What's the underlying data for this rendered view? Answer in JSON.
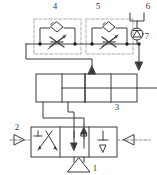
{
  "diagram": {
    "type": "pneumatic-hydraulic-schematic",
    "colors": {
      "line": "#3a3a3a",
      "dashed": "#8c8c8c",
      "background": "#ffffff",
      "node": "#1a1a1a"
    },
    "callouts": [
      {
        "id": "c1",
        "label": "1",
        "x": 84,
        "y": 168,
        "refers_to": "pressure-supply-source"
      },
      {
        "id": "c2",
        "label": "2",
        "x": 17,
        "y": 128,
        "refers_to": "left-exhaust-port"
      },
      {
        "id": "c3",
        "label": "3",
        "x": 117,
        "y": 108,
        "refers_to": "double-acting-cylinder"
      },
      {
        "id": "c4",
        "label": "4",
        "x": 55,
        "y": 9,
        "refers_to": "left-throttle-check-valve"
      },
      {
        "id": "c5",
        "label": "5",
        "x": 98,
        "y": 9,
        "refers_to": "right-throttle-check-valve"
      },
      {
        "id": "c6",
        "label": "6",
        "x": 148,
        "y": 8,
        "refers_to": "vent-silencer"
      },
      {
        "id": "c7",
        "label": "7",
        "x": 147,
        "y": 37,
        "refers_to": "check-valve"
      }
    ],
    "components": [
      {
        "name": "left-throttle-check-valve",
        "symbol": "adjustable throttle with parallel check valve"
      },
      {
        "name": "right-throttle-check-valve",
        "symbol": "adjustable throttle with parallel check valve"
      },
      {
        "name": "vent-silencer",
        "symbol": "open bracket vent / silencer"
      },
      {
        "name": "check-valve",
        "symbol": "circle with upward triangle"
      },
      {
        "name": "double-acting-cylinder",
        "symbol": "cylinder with piston and rod"
      },
      {
        "name": "directional-control-valve",
        "symbol": "2-position 5-port valve, crossed and straight flow paths"
      },
      {
        "name": "pressure-supply-source",
        "symbol": "upward triangle"
      },
      {
        "name": "left-exhaust-port",
        "symbol": "right pointing triangle"
      },
      {
        "name": "right-exhaust-port",
        "symbol": "left pointing triangle"
      }
    ]
  }
}
